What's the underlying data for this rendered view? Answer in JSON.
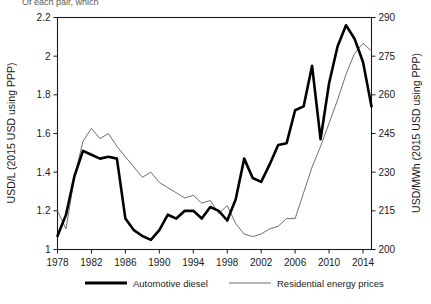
{
  "caption": {
    "truncated_text": "Of each pair, which"
  },
  "legend": {
    "position": "bottom",
    "entries": [
      {
        "label": "Automotive diesel",
        "style": "thick-solid-black",
        "color": "#000000"
      },
      {
        "label": "Residential energy prices",
        "style": "thin-solid-gray",
        "color": "#5e5e5e"
      }
    ]
  },
  "chart_data": {
    "type": "line",
    "title": "",
    "xlabel": "",
    "ylabel": "USD/L (2015 USD using PPP)",
    "y2label": "USD/MWh (2015 USD using PPP)",
    "grid": false,
    "xlim": [
      1978,
      2015
    ],
    "ylim": [
      1,
      2.2
    ],
    "y2lim": [
      200,
      290
    ],
    "xticks": [
      1978,
      1982,
      1986,
      1990,
      1994,
      1998,
      2002,
      2006,
      2010,
      2014
    ],
    "yticks": [
      1,
      1.2,
      1.4,
      1.6,
      1.8,
      2,
      2.2
    ],
    "y2ticks": [
      200,
      215,
      230,
      245,
      260,
      275,
      290
    ],
    "x": [
      1978,
      1979,
      1980,
      1981,
      1982,
      1983,
      1984,
      1985,
      1986,
      1987,
      1988,
      1989,
      1990,
      1991,
      1992,
      1993,
      1994,
      1995,
      1996,
      1997,
      1998,
      1999,
      2000,
      2001,
      2002,
      2003,
      2004,
      2005,
      2006,
      2007,
      2008,
      2009,
      2010,
      2011,
      2012,
      2013,
      2014,
      2015
    ],
    "series": [
      {
        "name": "Automotive diesel",
        "axis": "left",
        "unit": "USD/L (2015 USD using PPP)",
        "color": "#000000",
        "values": [
          1.07,
          1.18,
          1.38,
          1.51,
          1.49,
          1.47,
          1.48,
          1.47,
          1.16,
          1.1,
          1.07,
          1.05,
          1.1,
          1.18,
          1.16,
          1.2,
          1.2,
          1.16,
          1.22,
          1.2,
          1.15,
          1.26,
          1.47,
          1.37,
          1.35,
          1.44,
          1.54,
          1.55,
          1.72,
          1.74,
          1.95,
          1.57,
          1.86,
          2.05,
          2.16,
          2.09,
          1.97,
          1.74
        ]
      },
      {
        "name": "Residential energy prices",
        "axis": "right",
        "unit": "USD/MWh (2015 USD using PPP)",
        "color": "#5e5e5e",
        "values": [
          215.0,
          208.0,
          228.0,
          242.0,
          247.0,
          243.0,
          245.0,
          240.0,
          236.0,
          232.0,
          228.0,
          230.0,
          226.0,
          224.0,
          222.0,
          220.0,
          221.0,
          218.0,
          219.0,
          214.0,
          217.0,
          210.0,
          206.0,
          205.0,
          206.0,
          208.0,
          209.0,
          212.0,
          212.0,
          222.0,
          232.0,
          240.0,
          249.0,
          258.0,
          268.0,
          276.0,
          280.0,
          277.0
        ]
      }
    ]
  }
}
